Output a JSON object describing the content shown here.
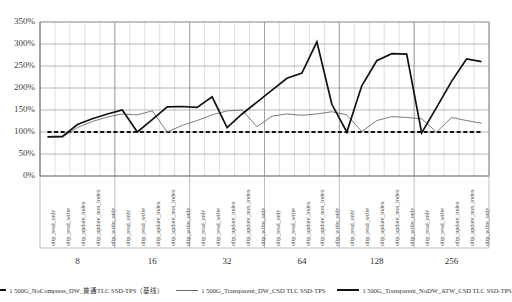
{
  "chart_data": {
    "type": "line",
    "title": "",
    "xlabel": "",
    "ylabel": "",
    "ylim": [
      0,
      350
    ],
    "ytick_labels": [
      "0%",
      "50%",
      "100%",
      "150%",
      "200%",
      "250%",
      "300%",
      "350%"
    ],
    "yticks": [
      0,
      50,
      100,
      150,
      200,
      250,
      300,
      350
    ],
    "grid": true,
    "legend_position": "bottom",
    "group_labels": [
      "8",
      "16",
      "32",
      "64",
      "128",
      "256"
    ],
    "workloads": [
      "oltp_read_only",
      "oltp_read_write",
      "oltp_update_index",
      "oltp_update_non_index",
      "oltp_write_only"
    ],
    "categories": [
      "oltp_read_only",
      "oltp_read_write",
      "oltp_update_index",
      "oltp_update_non_index",
      "oltp_write_only",
      "oltp_read_only",
      "oltp_read_write",
      "oltp_update_index",
      "oltp_update_non_index",
      "oltp_write_only",
      "oltp_read_only",
      "oltp_read_write",
      "oltp_update_index",
      "oltp_update_non_index",
      "oltp_write_only",
      "oltp_read_only",
      "oltp_read_write",
      "oltp_update_index",
      "oltp_update_non_index",
      "oltp_write_only",
      "oltp_read_only",
      "oltp_read_write",
      "oltp_update_index",
      "oltp_update_non_index",
      "oltp_write_only",
      "oltp_read_only",
      "oltp_read_write",
      "oltp_update_index",
      "oltp_update_non_index",
      "oltp_write_only"
    ],
    "series": [
      {
        "name": "1 500G_NoCompress_DW_普通TLC SSD-TPS（基线）",
        "style": "dashed",
        "color": "#111111",
        "values": [
          100,
          100,
          100,
          100,
          100,
          100,
          100,
          100,
          100,
          100,
          100,
          100,
          100,
          100,
          100,
          100,
          100,
          100,
          100,
          100,
          100,
          100,
          100,
          100,
          100,
          100,
          100,
          100,
          100,
          100
        ]
      },
      {
        "name": "1 500G_Transparent_DW_CSD TLC SSD-TPS",
        "style": "thin",
        "color": "#6b6b6b",
        "values": [
          89,
          88,
          110,
          124,
          134,
          141,
          139,
          148,
          100,
          115,
          126,
          139,
          148,
          150,
          112,
          136,
          141,
          138,
          141,
          146,
          139,
          101,
          126,
          135,
          133,
          130,
          100,
          133,
          126,
          120
        ]
      },
      {
        "name": "1 500G_Transparent_NoDW_ATW_CSD TLC SSD-TPS",
        "style": "thick",
        "color": "#111111",
        "values": [
          89,
          90,
          117,
          130,
          141,
          150,
          100,
          128,
          157,
          158,
          156,
          180,
          110,
          141,
          168,
          195,
          222,
          234,
          305,
          163,
          100,
          205,
          262,
          278,
          277,
          98,
          156,
          215,
          266,
          260
        ]
      }
    ]
  },
  "legend": {
    "items": [
      {
        "label": "1 500G_NoCompress_DW_普通TLC SSD-TPS（基线）",
        "style": "dashed"
      },
      {
        "label": "1 500G_Transparent_DW_CSD TLC SSD-TPS",
        "style": "thin"
      },
      {
        "label": "1 500G_Transparent_NoDW_ATW_CSD TLC SSD-TPS",
        "style": "thick"
      }
    ]
  }
}
